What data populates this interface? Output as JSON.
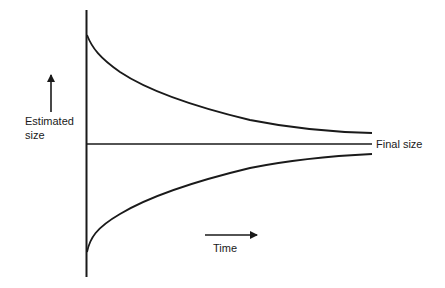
{
  "diagram": {
    "type": "convergence-diagram",
    "y_axis_label": {
      "line1": "Estimated",
      "line2": "size"
    },
    "x_axis_label": "Time",
    "reference_line_label": "Final size",
    "colors": {
      "stroke": "#1a1a1a",
      "background": "#ffffff"
    },
    "curves": [
      {
        "name": "overestimate",
        "description": "starts high, decreases toward final size"
      },
      {
        "name": "final-size",
        "description": "horizontal reference line"
      },
      {
        "name": "underestimate",
        "description": "starts low, increases toward final size"
      }
    ]
  }
}
